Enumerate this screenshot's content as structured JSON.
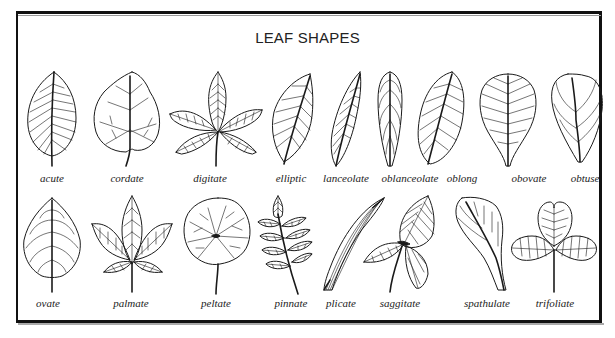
{
  "title": "LEAF SHAPES",
  "rows": [
    {
      "leaves": [
        {
          "name": "acute",
          "icon": "acute-leaf-icon"
        },
        {
          "name": "cordate",
          "icon": "cordate-leaf-icon"
        },
        {
          "name": "digitate",
          "icon": "digitate-leaf-icon"
        },
        {
          "name": "elliptic",
          "icon": "elliptic-leaf-icon"
        },
        {
          "name": "lanceolate",
          "icon": "lanceolate-leaf-icon"
        },
        {
          "name": "oblanceolate",
          "icon": "oblanceolate-leaf-icon"
        },
        {
          "name": "oblong",
          "icon": "oblong-leaf-icon"
        },
        {
          "name": "obovate",
          "icon": "obovate-leaf-icon"
        },
        {
          "name": "obtuse",
          "icon": "obtuse-leaf-icon"
        }
      ]
    },
    {
      "leaves": [
        {
          "name": "ovate",
          "icon": "ovate-leaf-icon"
        },
        {
          "name": "palmate",
          "icon": "palmate-leaf-icon"
        },
        {
          "name": "peltate",
          "icon": "peltate-leaf-icon"
        },
        {
          "name": "pinnate",
          "icon": "pinnate-leaf-icon"
        },
        {
          "name": "plicate",
          "icon": "plicate-leaf-icon"
        },
        {
          "name": "saggitate",
          "icon": "saggitate-leaf-icon"
        },
        {
          "name": "spathulate",
          "icon": "spathulate-leaf-icon"
        },
        {
          "name": "trifoliate",
          "icon": "trifoliate-leaf-icon"
        }
      ]
    }
  ],
  "colors": {
    "ink": "#1a1a1a",
    "background": "#ffffff",
    "frame": "#111111"
  }
}
